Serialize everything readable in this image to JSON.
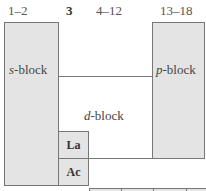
{
  "headers": {
    "s_groups": "1–2",
    "group3": "3",
    "d_groups": "4–12",
    "p_groups": "13–18"
  },
  "blocks": {
    "s": {
      "letter": "s",
      "suffix": "-block"
    },
    "d": {
      "letter": "d",
      "suffix": "-block"
    },
    "p": {
      "letter": "p",
      "suffix": "-block"
    }
  },
  "series": {
    "lanthanum": "La",
    "actinium": "Ac"
  },
  "colors": {
    "block_fill": "#e4e4e4",
    "border": "#777777"
  }
}
